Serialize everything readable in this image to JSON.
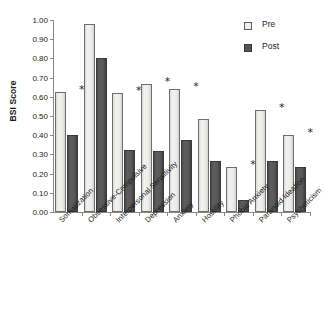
{
  "chart_data": {
    "type": "bar",
    "title": "",
    "xlabel": "",
    "ylabel": "BSI Score",
    "ylim": [
      0.0,
      1.0
    ],
    "ytick_labels": [
      "1.00",
      "0.90",
      "0.80",
      "0.70",
      "0.60",
      "0.50",
      "0.40",
      "0.30",
      "0.20",
      "0.10",
      "0.00"
    ],
    "ytick_values": [
      1.0,
      0.9,
      0.8,
      0.7,
      0.6,
      0.5,
      0.4,
      0.3,
      0.2,
      0.1,
      0.0
    ],
    "grid": false,
    "legend_position": "top-right",
    "categories": [
      "Somatization",
      "Obsessive-Compulsive",
      "Interpersonal Sensitivity",
      "Depression",
      "Anxiety",
      "Hostility",
      "Phobic Anxiety",
      "Paranoid Ideation",
      "Psychoticism"
    ],
    "series": [
      {
        "name": "Pre",
        "color": "#f0f0ee",
        "values": [
          0.625,
          0.978,
          0.618,
          0.665,
          0.642,
          0.485,
          0.235,
          0.532,
          0.4
        ]
      },
      {
        "name": "Post",
        "color": "#555555",
        "values": [
          0.4,
          0.802,
          0.322,
          0.318,
          0.373,
          0.265,
          0.065,
          0.265,
          0.235
        ]
      }
    ],
    "annotations": {
      "symbol": "*",
      "significant_categories": [
        "Somatization",
        "Interpersonal Sensitivity",
        "Depression",
        "Anxiety",
        "Phobic Anxiety",
        "Paranoid Ideation",
        "Psychoticism"
      ],
      "flags": [
        true,
        false,
        true,
        true,
        true,
        false,
        true,
        true,
        true
      ]
    }
  },
  "legend": {
    "items": [
      {
        "label": "Pre",
        "swatch": "light-square-swatch"
      },
      {
        "label": "Post",
        "swatch": "dark-square-swatch"
      }
    ]
  }
}
